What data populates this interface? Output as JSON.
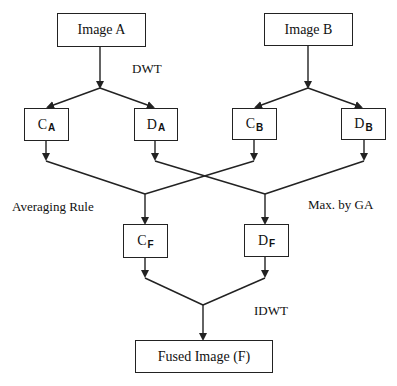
{
  "diagram": {
    "nodes": {
      "image_a": {
        "label": "Image A"
      },
      "image_b": {
        "label": "Image B"
      },
      "ca": {
        "main": "C",
        "sub": "A"
      },
      "da": {
        "main": "D",
        "sub": "A"
      },
      "cb": {
        "main": "C",
        "sub": "B"
      },
      "db": {
        "main": "D",
        "sub": "B"
      },
      "cf": {
        "main": "C",
        "sub": "F"
      },
      "df": {
        "main": "D",
        "sub": "F"
      },
      "fused": {
        "label": "Fused Image (F)"
      }
    },
    "labels": {
      "dwt": "DWT",
      "averaging": "Averaging Rule",
      "max_ga": "Max. by GA",
      "idwt": "IDWT"
    },
    "edges": [
      [
        "Image A",
        "C_A"
      ],
      [
        "Image A",
        "D_A"
      ],
      [
        "Image B",
        "C_B"
      ],
      [
        "Image B",
        "D_B"
      ],
      [
        "C_A",
        "C_F"
      ],
      [
        "C_B",
        "C_F"
      ],
      [
        "D_A",
        "D_F"
      ],
      [
        "D_B",
        "D_F"
      ],
      [
        "C_F",
        "Fused Image (F)"
      ],
      [
        "D_F",
        "Fused Image (F)"
      ]
    ],
    "colors": {
      "line": "#222222",
      "background": "#ffffff"
    }
  }
}
